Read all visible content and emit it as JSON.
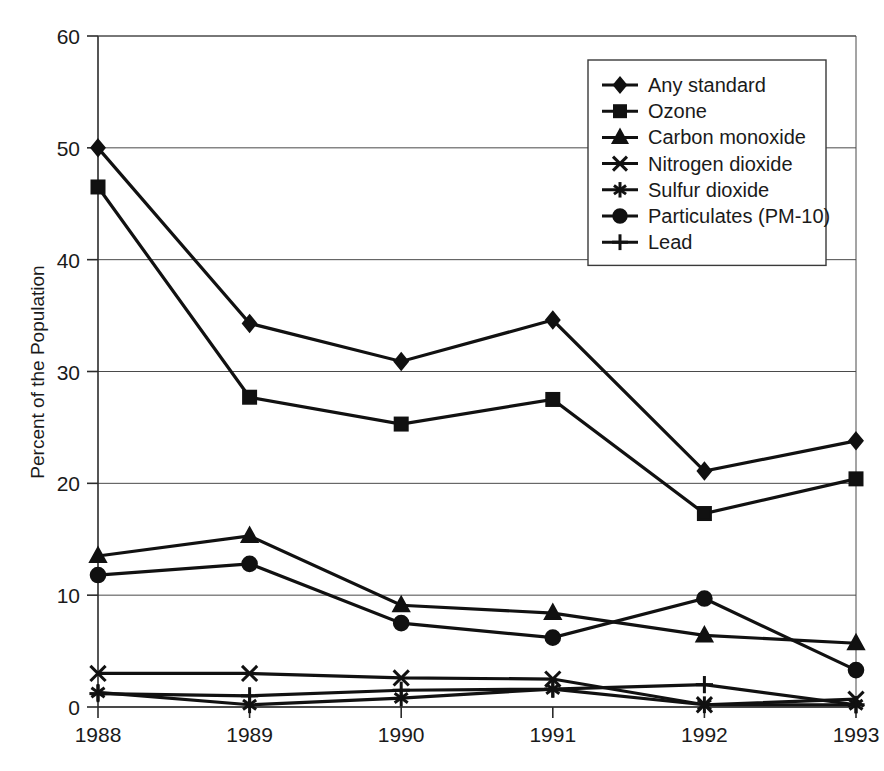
{
  "chart_data": {
    "type": "line",
    "title": "",
    "xlabel": "",
    "ylabel": "Percent of the Population",
    "x": [
      "1988",
      "1989",
      "1990",
      "1991",
      "1992",
      "1993"
    ],
    "categories": [
      "1988",
      "1989",
      "1990",
      "1991",
      "1992",
      "1993"
    ],
    "ylim": [
      0,
      60
    ],
    "yticks": [
      0,
      10,
      20,
      30,
      40,
      50,
      60
    ],
    "ytick_labels": [
      "0",
      "10",
      "20",
      "30",
      "40",
      "50",
      "60"
    ],
    "xtick_labels": [
      "1988",
      "1989",
      "1990",
      "1991",
      "1992",
      "1993"
    ],
    "grid": "horizontal",
    "legend_position": "top-right",
    "series": [
      {
        "name": "Any standard",
        "marker": "diamond",
        "values": [
          50.0,
          34.3,
          30.9,
          34.6,
          21.1,
          23.8
        ]
      },
      {
        "name": "Ozone",
        "marker": "square",
        "values": [
          46.5,
          27.7,
          25.3,
          27.5,
          17.3,
          20.4
        ]
      },
      {
        "name": "Carbon monoxide",
        "marker": "triangle",
        "values": [
          13.5,
          15.3,
          9.1,
          8.4,
          6.4,
          5.7
        ]
      },
      {
        "name": "Nitrogen dioxide",
        "marker": "x",
        "values": [
          3.0,
          3.0,
          2.6,
          2.5,
          0.2,
          0.7
        ]
      },
      {
        "name": "Sulfur dioxide",
        "marker": "asterisk",
        "values": [
          1.3,
          0.2,
          0.8,
          1.6,
          0.2,
          0.2
        ]
      },
      {
        "name": "Particulates (PM-10)",
        "marker": "circle",
        "values": [
          11.8,
          12.8,
          7.5,
          6.2,
          9.7,
          3.3
        ]
      },
      {
        "name": "Lead",
        "marker": "plus",
        "values": [
          1.2,
          1.0,
          1.5,
          1.6,
          2.0,
          0.2
        ]
      }
    ]
  },
  "legend": {
    "entries": [
      {
        "label": "Any standard",
        "marker": "diamond"
      },
      {
        "label": "Ozone",
        "marker": "square"
      },
      {
        "label": "Carbon monoxide",
        "marker": "triangle"
      },
      {
        "label": "Nitrogen dioxide",
        "marker": "x"
      },
      {
        "label": "Sulfur dioxide",
        "marker": "asterisk"
      },
      {
        "label": "Particulates (PM-10)",
        "marker": "circle"
      },
      {
        "label": "Lead",
        "marker": "plus"
      }
    ]
  },
  "colors": {
    "ink": "#111111",
    "grid": "#4a4a4a",
    "background": "#ffffff"
  }
}
